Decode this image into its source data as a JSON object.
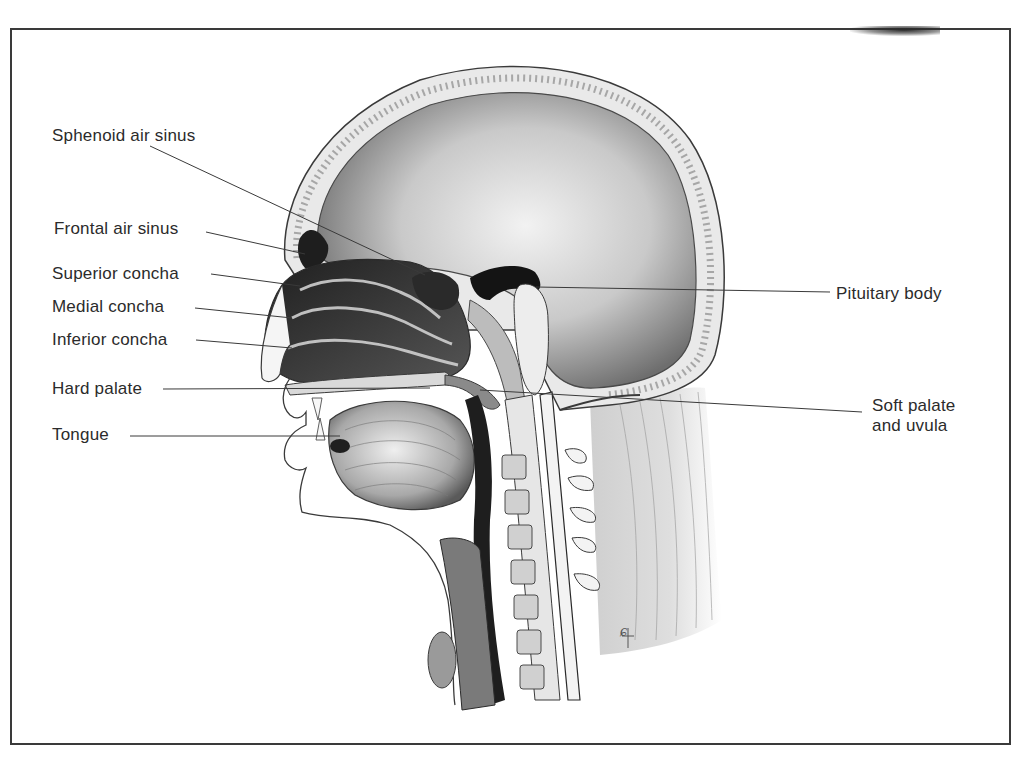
{
  "figure": {
    "artist_monogram": "CF",
    "frame_color": "#3a3a3a",
    "ink_color": "#2b2b2b"
  },
  "labels": {
    "left": [
      {
        "id": "sphenoid",
        "text": "Sphenoid air sinus"
      },
      {
        "id": "frontal",
        "text": "Frontal air sinus"
      },
      {
        "id": "superior",
        "text": "Superior concha"
      },
      {
        "id": "medial",
        "text": "Medial concha"
      },
      {
        "id": "inferior",
        "text": "Inferior concha"
      },
      {
        "id": "hard_palate",
        "text": "Hard palate"
      },
      {
        "id": "tongue",
        "text": "Tongue"
      }
    ],
    "right": [
      {
        "id": "pituitary",
        "text": "Pituitary body"
      },
      {
        "id": "soft_palate",
        "lines": [
          "Soft palate",
          "and uvula"
        ]
      }
    ]
  }
}
